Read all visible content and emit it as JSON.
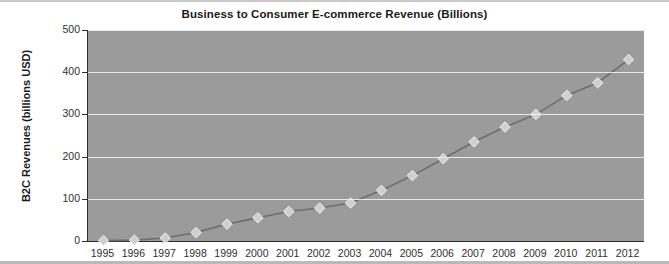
{
  "chart_data": {
    "type": "line",
    "title": "Business to Consumer E-commerce Revenue (Billions)",
    "xlabel": "",
    "ylabel": "B2C Revenues (billions USD)",
    "categories": [
      "1995",
      "1996",
      "1997",
      "1998",
      "1999",
      "2000",
      "2001",
      "2002",
      "2003",
      "2004",
      "2005",
      "2006",
      "2007",
      "2008",
      "2009",
      "2010",
      "2011",
      "2012"
    ],
    "values": [
      1,
      2,
      7,
      20,
      40,
      55,
      70,
      78,
      90,
      120,
      155,
      195,
      235,
      270,
      300,
      345,
      375,
      430
    ],
    "ylim": [
      0,
      500
    ],
    "yticks": [
      0,
      100,
      200,
      300,
      400,
      500
    ],
    "grid": true,
    "legend": false,
    "marker": "diamond",
    "series": [
      {
        "name": "B2C E-commerce Revenue",
        "values": [
          1,
          2,
          7,
          20,
          40,
          55,
          70,
          78,
          90,
          120,
          155,
          195,
          235,
          270,
          300,
          345,
          375,
          430
        ]
      }
    ],
    "colors": {
      "plot_background": "#9b9b9b",
      "gridline": "#efefef",
      "axis": "#2e2e2e",
      "line": "#6e6e6e",
      "marker_fill": "#cfcfcf",
      "marker_stroke": "#f2f2f2",
      "title_text": "#1a1a1a",
      "page_background": "#ffffff"
    }
  }
}
